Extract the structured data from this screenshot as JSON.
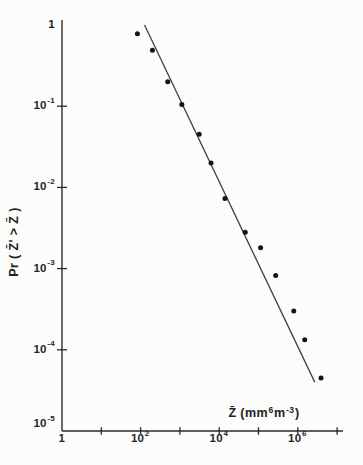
{
  "colors": {
    "background": "#fcfcfa",
    "ink": "#2a2a2a",
    "point": "#141414",
    "fit_line": "#3c3c3c"
  },
  "chart_data": {
    "type": "scatter",
    "title": "",
    "xlabel": "Z̄ (mm⁶m⁻³)",
    "ylabel": "Pr ( Z̄' > Z̄ )",
    "xlabel_parts": {
      "p1": "Z̄ (mm",
      "sup1": "6",
      "p2": "m",
      "sup2": "-3",
      "p3": ")"
    },
    "x_scale": "log",
    "y_scale": "log",
    "xlim": [
      1,
      15000000
    ],
    "ylim": [
      1e-05,
      1.15
    ],
    "grid": false,
    "legend": "none",
    "points": [
      {
        "x": 83,
        "y": 0.78
      },
      {
        "x": 200,
        "y": 0.49
      },
      {
        "x": 490,
        "y": 0.2
      },
      {
        "x": 1120,
        "y": 0.105
      },
      {
        "x": 3100,
        "y": 0.045
      },
      {
        "x": 6200,
        "y": 0.02
      },
      {
        "x": 14000,
        "y": 0.0073
      },
      {
        "x": 46000,
        "y": 0.0028
      },
      {
        "x": 113000,
        "y": 0.0018
      },
      {
        "x": 273000,
        "y": 0.00082
      },
      {
        "x": 790000,
        "y": 0.0003
      },
      {
        "x": 1500000,
        "y": 0.000133
      },
      {
        "x": 3900000,
        "y": 4.5e-05
      }
    ],
    "fit_line": {
      "x1": 126,
      "y1": 1.0,
      "x2": 2700000,
      "y2": 4e-05,
      "slope_loglog": -1
    },
    "x_ticks": [
      {
        "value": 1,
        "base": "1",
        "exp": "",
        "show_tick": false,
        "show_label": true
      },
      {
        "value": 10,
        "base": "",
        "exp": "",
        "show_tick": true,
        "show_label": false
      },
      {
        "value": 100,
        "base": "10",
        "exp": "2",
        "show_tick": true,
        "show_label": true
      },
      {
        "value": 1000,
        "base": "",
        "exp": "",
        "show_tick": true,
        "show_label": false
      },
      {
        "value": 10000,
        "base": "10",
        "exp": "4",
        "show_tick": true,
        "show_label": true
      },
      {
        "value": 100000,
        "base": "",
        "exp": "",
        "show_tick": true,
        "show_label": false
      },
      {
        "value": 1000000,
        "base": "10",
        "exp": "6",
        "show_tick": true,
        "show_label": true
      },
      {
        "value": 10000000,
        "base": "",
        "exp": "",
        "show_tick": true,
        "show_label": false
      }
    ],
    "y_ticks": [
      {
        "value": 1,
        "base": "1",
        "exp": "",
        "show_tick": false,
        "show_label": true,
        "dy": 0
      },
      {
        "value": 0.1,
        "base": "10",
        "exp": "-1",
        "show_tick": true,
        "show_label": true,
        "dy": 0
      },
      {
        "value": 0.01,
        "base": "10",
        "exp": "-2",
        "show_tick": true,
        "show_label": true,
        "dy": 0
      },
      {
        "value": 0.001,
        "base": "10",
        "exp": "-3",
        "show_tick": true,
        "show_label": true,
        "dy": 0
      },
      {
        "value": 0.0001,
        "base": "10",
        "exp": "-4",
        "show_tick": true,
        "show_label": true,
        "dy": 0
      },
      {
        "value": 1e-05,
        "base": "10",
        "exp": "-5",
        "show_tick": false,
        "show_label": true,
        "dy": -7
      }
    ]
  }
}
